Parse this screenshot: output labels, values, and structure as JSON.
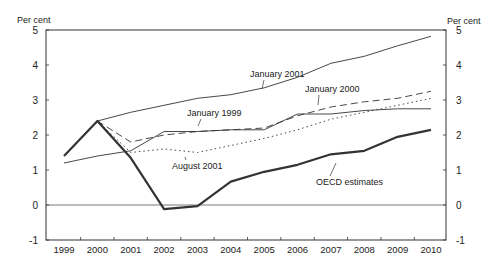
{
  "chart_data": {
    "type": "line",
    "title": "",
    "ylabel_left": "Per cent",
    "ylabel_right": "Per cent",
    "xlabel": "",
    "ylim": [
      -1,
      5
    ],
    "yticks": [
      -1,
      0,
      1,
      2,
      3,
      4,
      5
    ],
    "categories": [
      "1999",
      "2000",
      "2001",
      "2002",
      "2003",
      "2004",
      "2005",
      "2006",
      "2007",
      "2008",
      "2009",
      "2010"
    ],
    "grid": false,
    "zero_line": true,
    "series": [
      {
        "name": "OECD estimates",
        "style": "thick-solid",
        "values": [
          1.4,
          2.4,
          1.35,
          -0.12,
          -0.03,
          0.67,
          0.95,
          1.15,
          1.45,
          1.55,
          1.95,
          2.15
        ]
      },
      {
        "name": "January 1999",
        "style": "thin-solid",
        "values": [
          1.2,
          1.4,
          1.55,
          2.1,
          2.1,
          2.15,
          2.15,
          2.6,
          2.6,
          2.7,
          2.75,
          2.75
        ]
      },
      {
        "name": "January 2000",
        "style": "dashed",
        "values": [
          null,
          2.4,
          1.8,
          2.0,
          2.1,
          2.15,
          2.2,
          2.55,
          2.8,
          2.95,
          3.05,
          3.25
        ]
      },
      {
        "name": "January 2001",
        "style": "thin-solid",
        "values": [
          null,
          2.4,
          2.65,
          2.85,
          3.05,
          3.15,
          3.35,
          3.65,
          4.05,
          4.25,
          4.55,
          4.82
        ]
      },
      {
        "name": "August 2001",
        "style": "dotted",
        "values": [
          null,
          2.4,
          1.5,
          1.6,
          1.5,
          1.7,
          1.9,
          2.15,
          2.45,
          2.65,
          2.85,
          3.05
        ]
      }
    ],
    "annotations": [
      {
        "text": "January 2001",
        "x": 250,
        "y": 77,
        "arrow_to": [
          262,
          89
        ]
      },
      {
        "text": "January 2000",
        "x": 305,
        "y": 92,
        "arrow_to": [
          318,
          105
        ]
      },
      {
        "text": "January 1999",
        "x": 187,
        "y": 116,
        "arrow_to": [
          198,
          126
        ]
      },
      {
        "text": "August 2001",
        "x": 172,
        "y": 169,
        "arrow_to": [
          185,
          157
        ]
      },
      {
        "text": "OECD estimates",
        "x": 316,
        "y": 185,
        "arrow_to": [
          336,
          163
        ]
      }
    ]
  }
}
